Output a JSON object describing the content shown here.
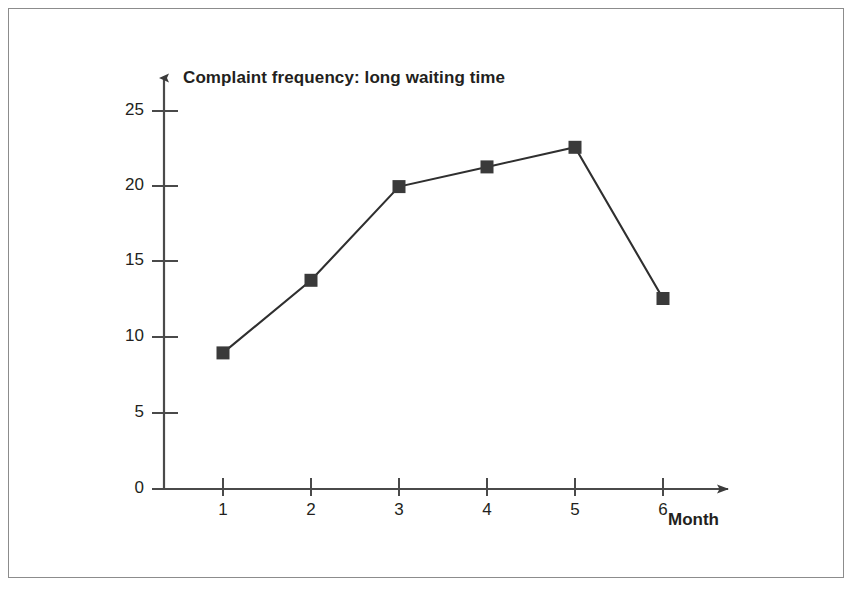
{
  "chart_data": {
    "type": "line",
    "title": "Complaint frequency: long waiting time",
    "xlabel": "Month",
    "ylabel": "",
    "x": [
      1,
      2,
      3,
      4,
      5,
      6
    ],
    "values": [
      9.0,
      13.8,
      20.0,
      21.3,
      22.6,
      12.6
    ],
    "categories": [
      "1",
      "2",
      "3",
      "4",
      "5",
      "6"
    ],
    "x_tick_labels": [
      "1",
      "2",
      "3",
      "4",
      "5",
      "6"
    ],
    "y_tick_labels": [
      "0",
      "5",
      "10",
      "15",
      "20",
      "25"
    ],
    "y_ticks": [
      0,
      5,
      10,
      15,
      20,
      25
    ],
    "xlim": [
      0.6,
      6.9
    ],
    "ylim": [
      0,
      26.5
    ],
    "grid": false,
    "legend": false,
    "marker": "square",
    "series": [
      {
        "name": "Complaint frequency: long waiting time",
        "values": [
          9.0,
          13.8,
          20.0,
          21.3,
          22.6,
          12.6
        ]
      }
    ],
    "colors": {
      "line": "#2f2f2f",
      "marker": "#3a3a3a",
      "axis": "#4a4a4a",
      "text": "#231f20",
      "frame": "#8c8c8c",
      "background": "#ffffff"
    }
  },
  "figure": {
    "border_present": "yes"
  }
}
